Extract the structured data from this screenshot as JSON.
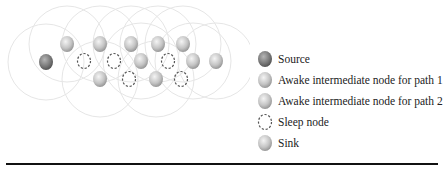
{
  "legend": {
    "items": [
      {
        "key": "source",
        "label": "Source",
        "icon": "source-node-icon"
      },
      {
        "key": "path1",
        "label": "Awake intermediate node for path 1",
        "icon": "awake-node-path1-icon"
      },
      {
        "key": "path2",
        "label": "Awake intermediate node for path 2",
        "icon": "awake-node-path2-icon"
      },
      {
        "key": "sleep",
        "label": "Sleep node",
        "icon": "sleep-node-icon"
      },
      {
        "key": "sink",
        "label": "Sink",
        "icon": "sink-node-icon"
      }
    ]
  },
  "colors": {
    "source": "#7a7a7a",
    "awake": "#bdbdbd",
    "sleep_stroke": "#555555",
    "ring": "#e6e6e6",
    "rule": "#111111"
  },
  "diagram": {
    "nodes": [
      {
        "type": "source",
        "x": 46,
        "y": 62
      },
      {
        "type": "path1",
        "x": 67,
        "y": 44
      },
      {
        "type": "path1",
        "x": 100,
        "y": 44
      },
      {
        "type": "path1",
        "x": 131,
        "y": 44
      },
      {
        "type": "path1",
        "x": 158,
        "y": 44
      },
      {
        "type": "path1",
        "x": 183,
        "y": 44
      },
      {
        "type": "sleep",
        "x": 84,
        "y": 61
      },
      {
        "type": "sleep",
        "x": 114,
        "y": 61
      },
      {
        "type": "path2",
        "x": 141,
        "y": 61
      },
      {
        "type": "sleep",
        "x": 168,
        "y": 61
      },
      {
        "type": "path2",
        "x": 193,
        "y": 61
      },
      {
        "type": "sink",
        "x": 216,
        "y": 61
      },
      {
        "type": "path2",
        "x": 100,
        "y": 79
      },
      {
        "type": "sleep",
        "x": 129,
        "y": 79
      },
      {
        "type": "path2",
        "x": 156,
        "y": 79
      },
      {
        "type": "sleep",
        "x": 181,
        "y": 79
      }
    ],
    "ring_radius": 38
  }
}
